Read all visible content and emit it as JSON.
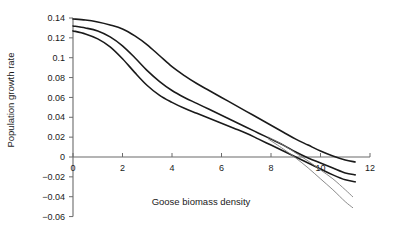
{
  "chart_data": {
    "type": "line",
    "title": "",
    "xlabel": "Goose biomass density",
    "ylabel": "Population growth rate",
    "xlim": [
      0,
      12
    ],
    "ylim": [
      -0.06,
      0.14
    ],
    "xticks": [
      0,
      2,
      4,
      6,
      8,
      10,
      12
    ],
    "xtick_labels": [
      "0",
      "2",
      "4",
      "6",
      "8",
      "10",
      "12"
    ],
    "yticks": [
      -0.06,
      -0.04,
      -0.02,
      0,
      0.02,
      0.04,
      0.06,
      0.08,
      0.1,
      0.12,
      0.14
    ],
    "ytick_labels": [
      "-0.06",
      "-0.04",
      "-0.02",
      "0",
      "0.02",
      "0.04",
      "0.06",
      "0.08",
      "0.1",
      "0.12",
      "0.14"
    ],
    "grid": false,
    "legend": null,
    "legend_position": "none",
    "zero_line": true,
    "series": [
      {
        "name": "upper curve",
        "style": "bold",
        "x": [
          0,
          0.5,
          1,
          1.5,
          2,
          2.5,
          3,
          3.5,
          4,
          4.5,
          5,
          5.5,
          6,
          6.5,
          7,
          7.5,
          8,
          8.5,
          9,
          9.5,
          10,
          10.5,
          11,
          11.4
        ],
        "y": [
          0.139,
          0.138,
          0.136,
          0.133,
          0.129,
          0.122,
          0.113,
          0.102,
          0.091,
          0.082,
          0.074,
          0.067,
          0.06,
          0.053,
          0.046,
          0.039,
          0.032,
          0.025,
          0.018,
          0.012,
          0.006,
          0.001,
          -0.003,
          -0.005
        ]
      },
      {
        "name": "middle curve",
        "style": "bold",
        "x": [
          0,
          0.5,
          1,
          1.5,
          2,
          2.5,
          3,
          3.5,
          4,
          4.5,
          5,
          5.5,
          6,
          6.5,
          7,
          7.5,
          8,
          8.5,
          9,
          9.5,
          10,
          10.5,
          11,
          11.4
        ],
        "y": [
          0.132,
          0.13,
          0.127,
          0.121,
          0.112,
          0.1,
          0.087,
          0.076,
          0.067,
          0.06,
          0.054,
          0.048,
          0.042,
          0.036,
          0.03,
          0.024,
          0.018,
          0.012,
          0.005,
          -0.001,
          -0.006,
          -0.011,
          -0.016,
          -0.018
        ]
      },
      {
        "name": "lower curve",
        "style": "bold",
        "x": [
          0,
          0.5,
          1,
          1.5,
          2,
          2.5,
          3,
          3.5,
          4,
          4.5,
          5,
          5.5,
          6,
          6.5,
          7,
          7.5,
          8,
          8.5,
          9,
          9.5,
          10,
          10.5,
          11,
          11.4
        ],
        "y": [
          0.127,
          0.124,
          0.119,
          0.111,
          0.099,
          0.085,
          0.072,
          0.062,
          0.055,
          0.049,
          0.044,
          0.039,
          0.034,
          0.029,
          0.024,
          0.018,
          0.012,
          0.006,
          0.0,
          -0.006,
          -0.012,
          -0.018,
          -0.023,
          -0.025
        ]
      },
      {
        "name": "thin divergent line 1",
        "style": "thin",
        "x": [
          7.9,
          8.5,
          9,
          9.5,
          10,
          10.5,
          11,
          11.3
        ],
        "y": [
          0.02,
          0.012,
          0.004,
          -0.004,
          -0.013,
          -0.022,
          -0.033,
          -0.04
        ]
      },
      {
        "name": "thin divergent line 2",
        "style": "thin",
        "x": [
          7.9,
          8.5,
          9,
          9.5,
          10,
          10.5,
          11,
          11.3
        ],
        "y": [
          0.018,
          0.008,
          -0.001,
          -0.011,
          -0.022,
          -0.033,
          -0.045,
          -0.051
        ]
      }
    ]
  }
}
